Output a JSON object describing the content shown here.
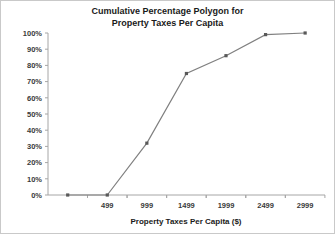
{
  "chart_data": {
    "type": "line",
    "title": "Cumulative Percentage Polygon for Property Taxes Per Capita",
    "title_line1": "Cumulative Percentage Polygon for",
    "title_line2": "Property Taxes Per Capita",
    "xlabel": "Property Taxes Per Capita ($)",
    "ylabel": "",
    "x": [
      -1,
      499,
      999,
      1499,
      1999,
      2499,
      2999
    ],
    "values": [
      0,
      0,
      32,
      75,
      86,
      99,
      100
    ],
    "xticklabels": [
      "499",
      "999",
      "1499",
      "1999",
      "2499",
      "2999"
    ],
    "xtickvalues": [
      499,
      999,
      1499,
      1999,
      2499,
      2999
    ],
    "yticklabels": [
      "0%",
      "10%",
      "20%",
      "30%",
      "40%",
      "50%",
      "60%",
      "70%",
      "80%",
      "90%",
      "100%"
    ],
    "ytickvalues": [
      0,
      10,
      20,
      30,
      40,
      50,
      60,
      70,
      80,
      90,
      100
    ],
    "ylim": [
      0,
      100
    ],
    "xlim": [
      -250,
      3250
    ],
    "grid": false,
    "legend": false,
    "series_color": "#808080",
    "marker_color": "#595959",
    "axis_color": "#a6a6a6",
    "frame_color": "#c9c9c9",
    "points": [
      {
        "x": -1,
        "y": 0,
        "label": "0%"
      },
      {
        "x": 499,
        "y": 0,
        "label": "0%"
      },
      {
        "x": 999,
        "y": 32,
        "label": "32%"
      },
      {
        "x": 1499,
        "y": 75,
        "label": "75%"
      },
      {
        "x": 1999,
        "y": 86,
        "label": "86%"
      },
      {
        "x": 2499,
        "y": 99,
        "label": "99%"
      },
      {
        "x": 2999,
        "y": 100,
        "label": "100%"
      }
    ]
  }
}
